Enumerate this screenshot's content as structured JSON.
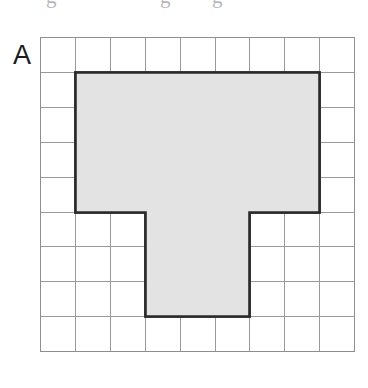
{
  "figure": {
    "label": "A",
    "label_name": "figure-label-a",
    "background_color": "#ffffff"
  },
  "cropped_text_above": {
    "present": true,
    "fragments": [
      {
        "text": "g",
        "x": 46
      },
      {
        "text": "g",
        "x": 160
      },
      {
        "text": "g",
        "x": 212
      }
    ],
    "color": "#8c8b92"
  },
  "grid": {
    "origin_x": 40,
    "origin_y": 37,
    "cols": 9,
    "rows": 9,
    "cell_size": 34.9,
    "line_color": "#9a9a9a",
    "border_color": "#8e8e8e",
    "background_color": "#ffffff"
  },
  "shape": {
    "name": "t-shaped-polygon",
    "fill_color": "#e3e3e3",
    "outline_color": "#2b2b2b",
    "outline_width": 2.6,
    "area_cells": 37,
    "perimeter_cells": 28,
    "parts": [
      {
        "name": "top-bar",
        "col_start": 1,
        "col_end": 8,
        "row_start": 1,
        "row_end": 5,
        "cells": 28
      },
      {
        "name": "stem",
        "col_start": 3,
        "col_end": 6,
        "row_start": 5,
        "row_end": 8,
        "cells": 9
      }
    ],
    "vertices_cells": [
      [
        1,
        1
      ],
      [
        8,
        1
      ],
      [
        8,
        5
      ],
      [
        6,
        5
      ],
      [
        6,
        8
      ],
      [
        3,
        8
      ],
      [
        3,
        5
      ],
      [
        1,
        5
      ]
    ]
  },
  "chart_data": {
    "type": "heatmap",
    "title": "A",
    "xlabel": "",
    "ylabel": "",
    "grid": true,
    "legend": "none",
    "x": [
      0,
      1,
      2,
      3,
      4,
      5,
      6,
      7,
      8
    ],
    "y": [
      0,
      1,
      2,
      3,
      4,
      5,
      6,
      7,
      8
    ],
    "categories": [
      "col0",
      "col1",
      "col2",
      "col3",
      "col4",
      "col5",
      "col6",
      "col7",
      "col8"
    ],
    "values": [
      [
        0,
        0,
        0,
        0,
        0,
        0,
        0,
        0,
        0
      ],
      [
        0,
        1,
        1,
        1,
        1,
        1,
        1,
        1,
        0
      ],
      [
        0,
        1,
        1,
        1,
        1,
        1,
        1,
        1,
        0
      ],
      [
        0,
        1,
        1,
        1,
        1,
        1,
        1,
        1,
        0
      ],
      [
        0,
        1,
        1,
        1,
        1,
        1,
        1,
        1,
        0
      ],
      [
        0,
        0,
        0,
        1,
        1,
        1,
        0,
        0,
        0
      ],
      [
        0,
        0,
        0,
        1,
        1,
        1,
        0,
        0,
        0
      ],
      [
        0,
        0,
        0,
        1,
        1,
        1,
        0,
        0,
        0
      ],
      [
        0,
        0,
        0,
        0,
        0,
        0,
        0,
        0,
        0
      ]
    ],
    "shaded_cell_count": 37,
    "total_cell_count": 81,
    "colors": {
      "shaded": "#e3e3e3",
      "empty": "#ffffff",
      "gridline": "#9a9a9a",
      "outline": "#2b2b2b"
    }
  }
}
